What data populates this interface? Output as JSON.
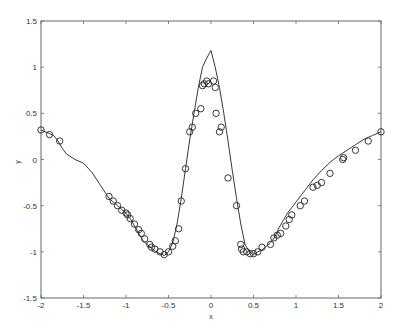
{
  "chart_data": {
    "type": "line",
    "title": "",
    "xlabel": "x",
    "ylabel": "y",
    "xlim": [
      -2,
      2
    ],
    "ylim": [
      -1.5,
      1.5
    ],
    "grid": false,
    "legend": null,
    "xticks": [
      -2,
      -1.5,
      -1,
      -0.5,
      0,
      0.5,
      1,
      1.5,
      2
    ],
    "xtick_labels": [
      "-2",
      "-1.5",
      "-1",
      "-0.5",
      "0",
      "0.5",
      "1",
      "1.5",
      "2"
    ],
    "yticks": [
      -1.5,
      -1,
      -0.5,
      0,
      0.5,
      1,
      1.5
    ],
    "ytick_labels": [
      "-1.5",
      "-1",
      "-0.5",
      "0",
      "0.5",
      "1",
      "1.5"
    ],
    "series": [
      {
        "name": "fitted curve",
        "style": "solid line",
        "x": [
          -2.0,
          -1.9,
          -1.85,
          -1.8,
          -1.75,
          -1.7,
          -1.6,
          -1.5,
          -1.4,
          -1.3,
          -1.2,
          -1.1,
          -1.0,
          -0.95,
          -0.9,
          -0.85,
          -0.8,
          -0.75,
          -0.7,
          -0.65,
          -0.6,
          -0.55,
          -0.5,
          -0.45,
          -0.4,
          -0.35,
          -0.3,
          -0.25,
          -0.2,
          -0.15,
          -0.1,
          -0.05,
          0.0,
          0.05,
          0.1,
          0.15,
          0.2,
          0.25,
          0.3,
          0.35,
          0.4,
          0.45,
          0.5,
          0.55,
          0.6,
          0.65,
          0.7,
          0.75,
          0.8,
          0.85,
          0.9,
          0.95,
          1.0,
          1.1,
          1.2,
          1.3,
          1.4,
          1.5,
          1.6,
          1.7,
          1.8,
          1.9,
          2.0
        ],
        "y": [
          0.32,
          0.28,
          0.26,
          0.2,
          0.12,
          0.06,
          0.0,
          -0.04,
          -0.14,
          -0.28,
          -0.42,
          -0.5,
          -0.58,
          -0.64,
          -0.72,
          -0.8,
          -0.88,
          -0.92,
          -0.96,
          -1.0,
          -1.02,
          -1.04,
          -1.0,
          -0.9,
          -0.7,
          -0.42,
          -0.1,
          0.22,
          0.5,
          0.78,
          1.0,
          1.1,
          1.18,
          1.0,
          0.78,
          0.5,
          0.2,
          -0.12,
          -0.42,
          -0.7,
          -0.92,
          -1.0,
          -1.03,
          -1.0,
          -0.98,
          -0.94,
          -0.9,
          -0.84,
          -0.74,
          -0.66,
          -0.58,
          -0.52,
          -0.46,
          -0.34,
          -0.22,
          -0.12,
          -0.03,
          0.04,
          0.1,
          0.16,
          0.22,
          0.26,
          0.3
        ]
      },
      {
        "name": "samples",
        "style": "open circle markers",
        "x": [
          -2.0,
          -1.9,
          -1.78,
          -1.2,
          -1.15,
          -1.1,
          -1.05,
          -1.0,
          -0.98,
          -0.95,
          -0.9,
          -0.85,
          -0.82,
          -0.78,
          -0.72,
          -0.7,
          -0.66,
          -0.6,
          -0.55,
          -0.5,
          -0.45,
          -0.42,
          -0.38,
          -0.35,
          -0.3,
          -0.25,
          -0.22,
          -0.18,
          -0.12,
          -0.1,
          -0.08,
          -0.05,
          -0.03,
          0.03,
          0.05,
          0.06,
          0.1,
          0.12,
          0.2,
          0.3,
          0.35,
          0.36,
          0.38,
          0.42,
          0.46,
          0.5,
          0.55,
          0.6,
          0.7,
          0.74,
          0.78,
          0.82,
          0.88,
          0.92,
          0.95,
          1.05,
          1.1,
          1.2,
          1.25,
          1.3,
          1.4,
          1.55,
          1.56,
          1.7,
          1.85,
          2.0
        ],
        "y": [
          0.32,
          0.27,
          0.2,
          -0.4,
          -0.45,
          -0.5,
          -0.55,
          -0.58,
          -0.6,
          -0.64,
          -0.7,
          -0.76,
          -0.8,
          -0.86,
          -0.92,
          -0.95,
          -0.97,
          -1.0,
          -1.03,
          -1.0,
          -0.94,
          -0.88,
          -0.75,
          -0.45,
          -0.1,
          0.3,
          0.35,
          0.5,
          0.55,
          0.8,
          0.82,
          0.85,
          0.82,
          0.85,
          0.78,
          0.5,
          0.3,
          0.35,
          -0.2,
          -0.5,
          -0.92,
          -0.97,
          -1.0,
          -1.0,
          -1.02,
          -1.02,
          -1.0,
          -0.95,
          -0.92,
          -0.85,
          -0.82,
          -0.8,
          -0.72,
          -0.65,
          -0.6,
          -0.5,
          -0.45,
          -0.3,
          -0.28,
          -0.25,
          -0.15,
          0.0,
          0.02,
          0.1,
          0.2,
          0.3
        ]
      }
    ]
  }
}
